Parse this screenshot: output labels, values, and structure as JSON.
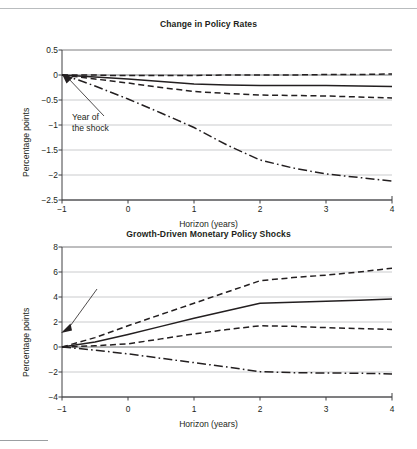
{
  "figures": [
    {
      "id": "policy-rates",
      "title": "Change in Policy Rates",
      "xlabel": "Horizon (years)",
      "ylabel": "Percentage points",
      "annotation": "Year of\nthe shock",
      "yticks": [
        "0.5",
        "0",
        "−0.5",
        "−1",
        "−1.5",
        "−2",
        "−2.5"
      ],
      "xticks": [
        "−1",
        "0",
        "1",
        "2",
        "3",
        "4"
      ]
    },
    {
      "id": "growth-shocks",
      "title": "Growth-Driven Monetary Policy Shocks",
      "xlabel": "Horizon (years)",
      "ylabel": "Percentage points",
      "annotation": "Year of\nthe shock",
      "yticks": [
        "8",
        "6",
        "4",
        "2",
        "0",
        "−2",
        "−4"
      ],
      "xticks": [
        "−1",
        "0",
        "1",
        "2",
        "3",
        "4"
      ]
    }
  ],
  "chart_data": [
    {
      "type": "line",
      "id": "policy-rates",
      "title": "Change in Policy Rates",
      "xlabel": "Horizon (years)",
      "ylabel": "Percentage points",
      "xlim": [
        -1,
        4
      ],
      "ylim": [
        -2.5,
        0.5
      ],
      "yticks": [
        0.5,
        0,
        -0.5,
        -1,
        -1.5,
        -2,
        -2.5
      ],
      "xticks": [
        -1,
        0,
        1,
        2,
        3,
        4
      ],
      "grid": "horizontal",
      "legend": "none",
      "annotations": [
        {
          "text": "Year of the shock",
          "points_to_x": -1,
          "points_to_y": 0
        }
      ],
      "x": [
        -1,
        -0.75,
        -0.5,
        -0.25,
        0,
        0.5,
        1,
        1.5,
        2,
        2.5,
        3,
        3.5,
        4
      ],
      "series": [
        {
          "name": "point estimate",
          "style": "solid",
          "values": [
            0,
            -0.02,
            -0.04,
            -0.06,
            -0.08,
            -0.13,
            -0.18,
            -0.2,
            -0.21,
            -0.21,
            -0.21,
            -0.22,
            -0.23
          ]
        },
        {
          "name": "upper confidence band",
          "style": "dashed",
          "values": [
            0,
            0.0,
            0.0,
            -0.01,
            -0.01,
            -0.01,
            -0.01,
            0.0,
            0.0,
            0.0,
            0.01,
            0.01,
            0.02
          ]
        },
        {
          "name": "lower confidence band",
          "style": "dashed",
          "values": [
            0,
            -0.04,
            -0.08,
            -0.12,
            -0.16,
            -0.25,
            -0.33,
            -0.37,
            -0.4,
            -0.41,
            -0.42,
            -0.44,
            -0.46
          ]
        },
        {
          "name": "alternative specification",
          "style": "dash-dot",
          "values": [
            0,
            -0.1,
            -0.22,
            -0.35,
            -0.48,
            -0.76,
            -1.05,
            -1.4,
            -1.7,
            -1.86,
            -1.98,
            -2.05,
            -2.12
          ]
        }
      ]
    },
    {
      "type": "line",
      "id": "growth-shocks",
      "title": "Growth-Driven Monetary Policy Shocks",
      "xlabel": "Horizon (years)",
      "ylabel": "Percentage points",
      "xlim": [
        -1,
        4
      ],
      "ylim": [
        -4,
        8
      ],
      "yticks": [
        8,
        6,
        4,
        2,
        0,
        -2,
        -4
      ],
      "xticks": [
        -1,
        0,
        1,
        2,
        3,
        4
      ],
      "grid": "horizontal",
      "legend": "none",
      "annotations": [
        {
          "text": "Year of the shock",
          "points_to_x": -1,
          "points_to_y": 0
        }
      ],
      "x": [
        -1,
        -0.5,
        0,
        0.5,
        1,
        1.5,
        2,
        2.5,
        3,
        3.5,
        4
      ],
      "series": [
        {
          "name": "point estimate",
          "style": "solid",
          "values": [
            0,
            0.4,
            1.0,
            1.65,
            2.3,
            2.9,
            3.5,
            3.58,
            3.65,
            3.75,
            3.85
          ]
        },
        {
          "name": "upper confidence band",
          "style": "dashed",
          "values": [
            0,
            0.75,
            1.7,
            2.6,
            3.5,
            4.4,
            5.3,
            5.55,
            5.75,
            6.0,
            6.3
          ]
        },
        {
          "name": "lower confidence band",
          "style": "dashed",
          "values": [
            0,
            0.1,
            0.25,
            0.65,
            1.05,
            1.4,
            1.7,
            1.65,
            1.55,
            1.48,
            1.4
          ]
        },
        {
          "name": "alternative specification",
          "style": "dash-dot",
          "values": [
            0,
            -0.25,
            -0.55,
            -0.9,
            -1.25,
            -1.6,
            -1.97,
            -2.05,
            -2.08,
            -2.1,
            -2.15
          ]
        }
      ]
    }
  ]
}
